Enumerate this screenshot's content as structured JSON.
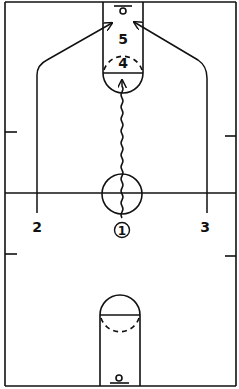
{
  "diagram": {
    "type": "basketball-play",
    "court": "full-court",
    "line_color": "#111111",
    "background": "#ffffff"
  },
  "players": [
    {
      "id": "1",
      "label": "1",
      "circled": true,
      "role": "ball-handler",
      "action": "dribble to top of key"
    },
    {
      "id": "2",
      "label": "2",
      "circled": false,
      "role": "left wing",
      "action": "cut to basket"
    },
    {
      "id": "3",
      "label": "3",
      "circled": false,
      "role": "right wing",
      "action": "cut to basket"
    },
    {
      "id": "4",
      "label": "4",
      "circled": false,
      "role": "high post"
    },
    {
      "id": "5",
      "label": "5",
      "circled": false,
      "role": "low post"
    }
  ],
  "legend": {
    "wavy_line": "dribble",
    "solid_arrow": "cut"
  }
}
